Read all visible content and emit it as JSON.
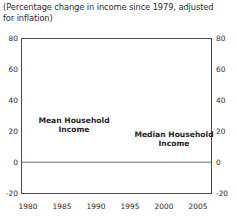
{
  "title": "(Percentage change in income since 1979, adjusted for inflation)",
  "annotations": {
    "mean": "Mean Household\nIncome",
    "median": "Median Household\nIncome"
  },
  "axis": {
    "y_ticks": [
      "80",
      "60",
      "40",
      "20",
      "0",
      "-20"
    ],
    "x_ticks": [
      "1980",
      "1985",
      "1990",
      "1995",
      "2000",
      "2005"
    ]
  },
  "colors": {
    "line": "#6b6b6b",
    "frame": "#4a4a4a",
    "recession_band": "#c9c9c9",
    "zero_line": "#6b6b6b",
    "text": "#2b2b2b"
  },
  "chart_data": {
    "type": "line",
    "title": "(Percentage change in income since 1979, adjusted for inflation)",
    "xlabel": "",
    "ylabel": "Percentage change in income since 1979",
    "xlim": [
      1979,
      2007
    ],
    "ylim": [
      -20,
      80
    ],
    "y_ticks": [
      -20,
      0,
      20,
      40,
      60,
      80
    ],
    "x_ticks": [
      1980,
      1985,
      1990,
      1995,
      2000,
      2005
    ],
    "grid": false,
    "legend_position": "inline-annotations",
    "dual_y_axis": true,
    "x": [
      1979,
      1980,
      1981,
      1982,
      1983,
      1984,
      1985,
      1986,
      1987,
      1988,
      1989,
      1990,
      1991,
      1992,
      1993,
      1994,
      1995,
      1996,
      1997,
      1998,
      1999,
      2000,
      2001,
      2002,
      2003,
      2004,
      2005,
      2006
    ],
    "series": [
      {
        "name": "Mean Household Income",
        "label": "Mean Household\nIncome",
        "values": [
          0,
          -3,
          -5,
          -6,
          -3,
          2,
          5,
          10,
          13,
          15,
          19,
          16,
          13,
          13,
          18,
          22,
          25,
          29,
          35,
          41,
          45,
          47,
          42,
          37,
          38,
          44,
          50,
          57
        ]
      },
      {
        "name": "Median Household Income",
        "label": "Median Household\nIncome",
        "values": [
          0,
          -4,
          -6,
          -7,
          -6,
          -3,
          -1,
          3,
          4,
          5,
          7,
          5,
          2,
          1,
          1,
          3,
          5,
          7,
          10,
          14,
          16,
          16,
          14,
          12,
          11,
          12,
          14,
          19
        ]
      }
    ],
    "recession_bands": [
      {
        "start": 1980.0,
        "end": 1980.6
      },
      {
        "start": 1981.5,
        "end": 1982.9
      },
      {
        "start": 1990.5,
        "end": 1991.2
      },
      {
        "start": 2001.1,
        "end": 2001.9
      }
    ]
  }
}
